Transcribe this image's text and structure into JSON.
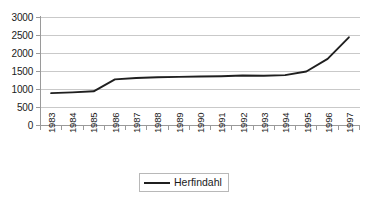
{
  "chart_data": {
    "type": "line",
    "title": "",
    "subtitle": "",
    "xlabel": "",
    "ylabel": "",
    "categories": [
      "1983",
      "1984",
      "1985",
      "1986",
      "1987",
      "1988",
      "1989",
      "1990",
      "1991",
      "1992",
      "1993",
      "1994",
      "1995",
      "1996",
      "1997"
    ],
    "series": [
      {
        "name": "Herfindahl",
        "color": "#1f1f1f",
        "values": [
          900,
          920,
          950,
          1280,
          1320,
          1340,
          1350,
          1360,
          1370,
          1390,
          1380,
          1400,
          1500,
          1850,
          2450
        ]
      }
    ],
    "ylim": [
      0,
      3000
    ],
    "yticks": [
      0,
      500,
      1000,
      1500,
      2000,
      2500,
      3000
    ],
    "ytick_labels": [
      "0",
      "500",
      "1000",
      "1500",
      "2000",
      "2500",
      "3000"
    ],
    "grid": true,
    "grid_axis": "y",
    "grid_color": "#c9c9c9",
    "axis_color": "#9a9a9a",
    "legend": {
      "position": "bottom",
      "entries": [
        {
          "label": "Herfindahl",
          "color": "#1f1f1f"
        }
      ]
    }
  }
}
